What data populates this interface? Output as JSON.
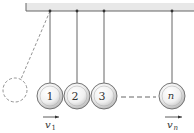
{
  "diagram": {
    "balls": [
      {
        "label": "1",
        "cx": 50,
        "pivot_x": 50
      },
      {
        "label": "2",
        "cx": 77,
        "pivot_x": 77
      },
      {
        "label": "3",
        "cx": 104,
        "pivot_x": 104
      },
      {
        "label": "n",
        "cx": 172,
        "pivot_x": 172
      }
    ],
    "velocity_labels": {
      "v1_main": "v",
      "v1_sub": "1",
      "vn_main": "v",
      "vn_sub": "n"
    },
    "colors": {
      "ceiling": "#e6e6e6",
      "string": "#555555",
      "ball_edge": "#666666",
      "dashed": "#777777"
    }
  }
}
